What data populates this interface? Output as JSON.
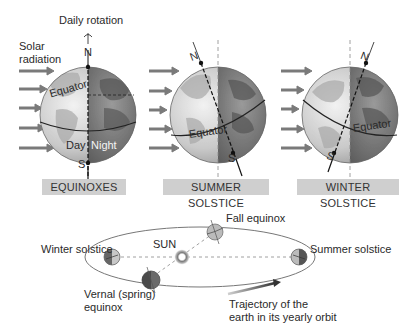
{
  "diagram": {
    "panels": [
      {
        "id": "equinoxes",
        "caption": "EQUINOXES",
        "labels": {
          "rotation": "Daily rotation",
          "solar": "Solar\nradiation",
          "solar_line1": "Solar",
          "solar_line2": "radiation",
          "north": "N",
          "south": "S",
          "equator": "Equator",
          "day": "Day",
          "night": "Night"
        },
        "tilt_deg": 0
      },
      {
        "id": "summer-solstice",
        "caption": "SUMMER SOLSTICE",
        "labels": {
          "north": "N",
          "south": "S",
          "equator": "Equator"
        },
        "tilt_deg": -23.5
      },
      {
        "id": "winter-solstice",
        "caption": "WINTER SOLSTICE",
        "labels": {
          "north": "N",
          "south": "S",
          "equator": "Equator"
        },
        "tilt_deg": 23.5
      }
    ],
    "orbit": {
      "sun_label": "SUN",
      "positions": [
        {
          "id": "winter",
          "label": "Winter solstice"
        },
        {
          "id": "fall",
          "label": "Fall equinox"
        },
        {
          "id": "summer",
          "label": "Summer solstice"
        },
        {
          "id": "vernal",
          "label_line1": "Vernal (spring)",
          "label_line2": "equinox"
        }
      ],
      "trajectory_line1": "Trajectory of the",
      "trajectory_line2": "earth in its yearly orbit"
    },
    "colors": {
      "day_side": "#c8c8c8",
      "night_side": "#6e6e6e",
      "arrow": "#7a7a7a",
      "caption_bg": "#cfcfcf",
      "orbit_line": "#777777"
    }
  }
}
